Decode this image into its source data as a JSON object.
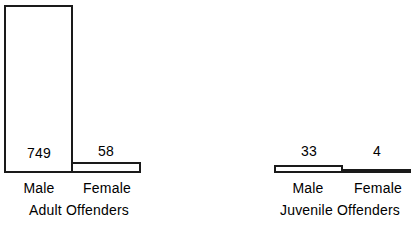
{
  "chart_data": {
    "type": "bar",
    "title": "",
    "subtitle": "",
    "xlabel": "",
    "ylabel": "",
    "orientation": "vertical",
    "grid": false,
    "legend": "none",
    "axis_visible": false,
    "ylim": [
      0,
      800
    ],
    "categories": [
      "Male",
      "Female"
    ],
    "groups": [
      {
        "name": "Adult Offenders",
        "categories": [
          "Male",
          "Female"
        ],
        "values": [
          749,
          58
        ],
        "value_labels": [
          "749",
          "58"
        ]
      },
      {
        "name": "Juvenile Offenders",
        "categories": [
          "Male",
          "Female"
        ],
        "values": [
          33,
          4
        ],
        "value_labels": [
          "33",
          "4"
        ]
      }
    ],
    "series": [
      {
        "name": "Male",
        "values": [
          749,
          33
        ]
      },
      {
        "name": "Female",
        "values": [
          58,
          4
        ]
      }
    ],
    "bar_style": {
      "fill": "#ffffff",
      "stroke": "#1a1a1a",
      "stroke_width": 2
    },
    "annotations": []
  },
  "groups": {
    "adult": {
      "title": "Adult Offenders",
      "bars": [
        {
          "label": "Male",
          "value": "749"
        },
        {
          "label": "Female",
          "value": "58"
        }
      ]
    },
    "juvenile": {
      "title": "Juvenile Offenders",
      "bars": [
        {
          "label": "Male",
          "value": "33"
        },
        {
          "label": "Female",
          "value": "4"
        }
      ]
    }
  },
  "colors": {
    "background": "#ffffff",
    "ink": "#1a1a1a",
    "bar_fill": "#ffffff"
  }
}
